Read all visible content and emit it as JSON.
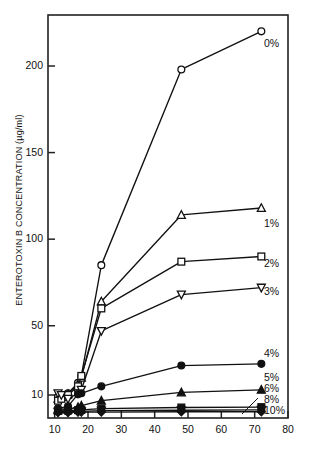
{
  "chart_data": {
    "type": "line",
    "title": "",
    "xlabel": "",
    "ylabel": "ENTEROTOXIN B CONCENTRATION (µg/ml)",
    "xlim": [
      8,
      80
    ],
    "ylim": [
      5,
      230
    ],
    "xticks": [
      10,
      20,
      30,
      40,
      50,
      60,
      70,
      80
    ],
    "xtick_labels": [
      "10",
      "20",
      "30",
      "40",
      "50",
      "60",
      "70",
      "80"
    ],
    "yticks": [
      10,
      50,
      100,
      150,
      200
    ],
    "ytick_labels": [
      "10",
      "50",
      "100",
      "150",
      "200"
    ],
    "grid": false,
    "legend_position": "right-inline",
    "y_scale_note": "compressed near baseline",
    "series": [
      {
        "name": "0%",
        "label": "0%",
        "marker": "open-circle",
        "x": [
          11,
          12,
          14,
          17,
          18,
          24,
          48,
          72
        ],
        "y": [
          9.5,
          10,
          11,
          17,
          21,
          85,
          198,
          220
        ]
      },
      {
        "name": "1%",
        "label": "1%",
        "marker": "open-triangle-up",
        "x": [
          11,
          12,
          14,
          17,
          18,
          24,
          48,
          72
        ],
        "y": [
          9,
          9.5,
          10.5,
          16,
          20,
          64,
          114,
          118
        ]
      },
      {
        "name": "2%",
        "label": "2%",
        "marker": "open-square",
        "x": [
          11,
          12,
          14,
          17,
          18,
          24,
          48,
          72
        ],
        "y": [
          8.5,
          9,
          10,
          15,
          21,
          60,
          87,
          90
        ]
      },
      {
        "name": "3%",
        "label": "3%",
        "marker": "open-triangle-down",
        "x": [
          11,
          12,
          14,
          17,
          18,
          24,
          48,
          72
        ],
        "y": [
          11,
          10,
          9,
          11,
          13,
          47,
          68,
          72
        ]
      },
      {
        "name": "4%",
        "label": "4%",
        "marker": "filled-circle",
        "x": [
          11,
          14,
          17,
          18,
          24,
          48,
          72
        ],
        "y": [
          6.5,
          7,
          10.5,
          11,
          15,
          27,
          28
        ]
      },
      {
        "name": "5%",
        "label": "5%",
        "marker": "filled-triangle-up",
        "x": [
          11,
          14,
          17,
          18,
          24,
          48,
          72
        ],
        "y": [
          6,
          6.2,
          6.8,
          7.2,
          8.5,
          11.5,
          13
        ]
      },
      {
        "name": "6%",
        "label": "6%",
        "marker": "filled-square",
        "x": [
          11,
          14,
          17,
          18,
          24,
          48,
          72
        ],
        "y": [
          5.8,
          5.9,
          6.0,
          6.1,
          6.4,
          6.7,
          6.8
        ]
      },
      {
        "name": "8%",
        "label": "8%",
        "marker": "filled-triangle-down",
        "x": [
          11,
          14,
          17,
          18,
          24,
          48,
          72
        ],
        "y": [
          5.6,
          5.6,
          5.7,
          5.7,
          5.9,
          6.0,
          6.1
        ]
      },
      {
        "name": "10%",
        "label": "10%",
        "marker": "filled-diamond",
        "x": [
          11,
          14,
          17,
          18,
          24,
          48,
          72
        ],
        "y": [
          5.4,
          5.4,
          5.5,
          5.5,
          5.5,
          5.6,
          5.6
        ]
      }
    ]
  },
  "axes": {
    "y_title": "ENTEROTOXIN B CONCENTRATION (µg/ml)",
    "y_ticks": [
      {
        "value": 200,
        "label": "200"
      },
      {
        "value": 150,
        "label": "150"
      },
      {
        "value": 100,
        "label": "100"
      },
      {
        "value": 50,
        "label": "50"
      },
      {
        "value": 10,
        "label": "10"
      }
    ],
    "x_ticks": [
      {
        "value": 10,
        "label": "10"
      },
      {
        "value": 20,
        "label": "20"
      },
      {
        "value": 30,
        "label": "30"
      },
      {
        "value": 40,
        "label": "40"
      },
      {
        "value": 50,
        "label": "50"
      },
      {
        "value": 60,
        "label": "60"
      },
      {
        "value": 70,
        "label": "70"
      },
      {
        "value": 80,
        "label": "80"
      }
    ]
  },
  "colors": {
    "line": "#111111",
    "frame": "#222222",
    "background": "#ffffff"
  }
}
